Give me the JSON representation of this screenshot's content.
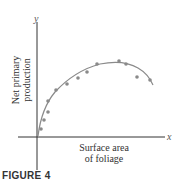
{
  "figure": {
    "caption": "FIGURE 4"
  },
  "chart_data": {
    "type": "scatter",
    "title": "",
    "xlabel": "Surface area of foliage",
    "ylabel": "Net primary production",
    "x_axis_var": "x",
    "y_axis_var": "y",
    "xlabel_lines": [
      "Surface area",
      "of foliage"
    ],
    "ylabel_lines": [
      "Net primary",
      "production"
    ],
    "grid": false,
    "legend": null,
    "ticks": "none",
    "points_pixel": [
      [
        41,
        129
      ],
      [
        44,
        120
      ],
      [
        48,
        112
      ],
      [
        48,
        101
      ],
      [
        56,
        90
      ],
      [
        67,
        84
      ],
      [
        78,
        78
      ],
      [
        87,
        72
      ],
      [
        97,
        64
      ],
      [
        119,
        61
      ],
      [
        126,
        64
      ],
      [
        137,
        77
      ],
      [
        150,
        80
      ]
    ],
    "points_relative": [
      {
        "x": 0.03,
        "y": 0.1
      },
      {
        "x": 0.05,
        "y": 0.22
      },
      {
        "x": 0.08,
        "y": 0.33
      },
      {
        "x": 0.08,
        "y": 0.48
      },
      {
        "x": 0.14,
        "y": 0.63
      },
      {
        "x": 0.22,
        "y": 0.71
      },
      {
        "x": 0.3,
        "y": 0.79
      },
      {
        "x": 0.37,
        "y": 0.88
      },
      {
        "x": 0.44,
        "y": 0.99
      },
      {
        "x": 0.6,
        "y": 1.03
      },
      {
        "x": 0.65,
        "y": 0.99
      },
      {
        "x": 0.73,
        "y": 0.81
      },
      {
        "x": 0.83,
        "y": 0.77
      }
    ],
    "fit_curve": "concave-down curve rising steeply from origin, peaking near x≈0.55, then declining",
    "series_color": "#8a8a8a",
    "curve_color": "#8a8a8a",
    "axis_color": "#333333"
  }
}
